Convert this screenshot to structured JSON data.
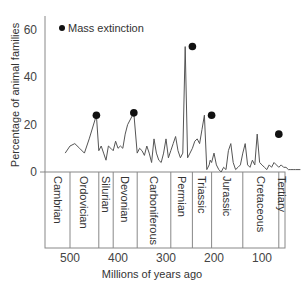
{
  "chart_data": {
    "type": "line",
    "title": "",
    "xlabel": "Millions of years ago",
    "ylabel": "Percentage of animal families",
    "ylim": [
      0,
      65
    ],
    "xlim": [
      550,
      10
    ],
    "x_reversed": true,
    "yticks": [
      "0",
      "20",
      "40",
      "60"
    ],
    "xticks": [
      "500",
      "400",
      "300",
      "200",
      "100"
    ],
    "grid": false,
    "legend": {
      "position": "top-left",
      "entries": [
        {
          "marker": "filled-circle",
          "label": "Mass extinction"
        }
      ]
    },
    "periods": [
      {
        "name": "Cambrian",
        "start": 550,
        "end": 500
      },
      {
        "name": "Ordovician",
        "start": 500,
        "end": 440
      },
      {
        "name": "Silurian",
        "start": 440,
        "end": 410
      },
      {
        "name": "Devonian",
        "start": 410,
        "end": 360
      },
      {
        "name": "Carboniferous",
        "start": 360,
        "end": 290
      },
      {
        "name": "Permian",
        "start": 290,
        "end": 245
      },
      {
        "name": "Triassic",
        "start": 245,
        "end": 205
      },
      {
        "name": "Jurassic",
        "start": 205,
        "end": 140
      },
      {
        "name": "Cretaceous",
        "start": 140,
        "end": 65
      },
      {
        "name": "Tertiary",
        "start": 65,
        "end": 20
      }
    ],
    "series": [
      {
        "name": "Extinction rate",
        "x": [
          510,
          500,
          490,
          480,
          470,
          460,
          445,
          440,
          435,
          430,
          425,
          420,
          415,
          410,
          405,
          400,
          395,
          390,
          385,
          380,
          367,
          360,
          355,
          350,
          345,
          340,
          335,
          330,
          325,
          320,
          315,
          310,
          305,
          300,
          295,
          290,
          285,
          280,
          275,
          270,
          265,
          260,
          255,
          250,
          245,
          240,
          235,
          230,
          225,
          220,
          215,
          210,
          208,
          205,
          200,
          195,
          190,
          185,
          180,
          175,
          170,
          165,
          160,
          155,
          150,
          145,
          140,
          135,
          130,
          125,
          120,
          115,
          110,
          105,
          100,
          95,
          90,
          85,
          80,
          75,
          70,
          65,
          60,
          55,
          50,
          45,
          40,
          35,
          30,
          25,
          20
        ],
        "values": [
          8,
          11,
          12,
          10,
          8,
          14,
          24,
          9,
          11,
          8,
          5,
          11,
          10,
          9,
          13,
          10,
          11,
          10,
          16,
          20,
          25,
          8,
          10,
          9,
          7,
          11,
          8,
          4,
          14,
          8,
          5,
          4,
          8,
          14,
          6,
          9,
          12,
          15,
          9,
          6,
          8,
          53,
          6,
          8,
          10,
          13,
          14,
          12,
          18,
          24,
          1,
          3,
          5,
          4,
          8,
          3,
          1,
          0,
          2,
          1,
          9,
          12,
          4,
          1,
          2,
          3,
          8,
          12,
          3,
          2,
          5,
          3,
          16,
          4,
          3,
          2,
          1,
          3,
          2,
          4,
          3,
          2,
          3,
          2,
          2,
          1,
          1,
          1,
          1,
          1,
          1
        ],
        "color": "#555555"
      }
    ],
    "mass_extinctions": [
      {
        "x": 445,
        "value": 24
      },
      {
        "x": 367,
        "value": 25
      },
      {
        "x": 245,
        "value": 53
      },
      {
        "x": 205,
        "value": 24
      },
      {
        "x": 65,
        "value": 16
      }
    ]
  }
}
